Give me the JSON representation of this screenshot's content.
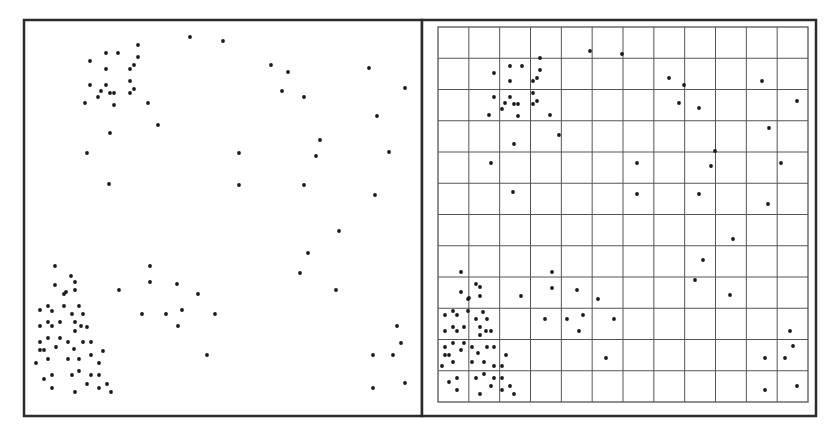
{
  "colors": {
    "background": "#ffffff",
    "frame": "#2a2a2a",
    "grid": "#555555",
    "point": "#1a1a1a"
  },
  "chart_data": [
    {
      "type": "scatter",
      "title": "",
      "xlabel": "",
      "ylabel": "",
      "grid": false,
      "legend": null,
      "panel": "left",
      "coordinate_space": "pixel",
      "points": [
        [
          138,
          45
        ],
        [
          106,
          53
        ],
        [
          118,
          53
        ],
        [
          90,
          61
        ],
        [
          138,
          57
        ],
        [
          106,
          69
        ],
        [
          134,
          65
        ],
        [
          130,
          69
        ],
        [
          90,
          85
        ],
        [
          106,
          85
        ],
        [
          130,
          81
        ],
        [
          134,
          89
        ],
        [
          101,
          91
        ],
        [
          110,
          93
        ],
        [
          114,
          93
        ],
        [
          130,
          93
        ],
        [
          98,
          97
        ],
        [
          85,
          103
        ],
        [
          114,
          105
        ],
        [
          148,
          103
        ],
        [
          158,
          125
        ],
        [
          110,
          133
        ],
        [
          87,
          153
        ],
        [
          109,
          184
        ],
        [
          190,
          37
        ],
        [
          223,
          41
        ],
        [
          271,
          65
        ],
        [
          288,
          72
        ],
        [
          282,
          91
        ],
        [
          304,
          97
        ],
        [
          369,
          68
        ],
        [
          405,
          88
        ],
        [
          377,
          116
        ],
        [
          320,
          140
        ],
        [
          316,
          156
        ],
        [
          239,
          153
        ],
        [
          389,
          152
        ],
        [
          239,
          185
        ],
        [
          304,
          185
        ],
        [
          375,
          195
        ],
        [
          339,
          231
        ],
        [
          308,
          253
        ],
        [
          300,
          273
        ],
        [
          336,
          290
        ],
        [
          397,
          326
        ],
        [
          401,
          343
        ],
        [
          373,
          355
        ],
        [
          393,
          355
        ],
        [
          373,
          388
        ],
        [
          405,
          383
        ],
        [
          150,
          266
        ],
        [
          150,
          282
        ],
        [
          177,
          284
        ],
        [
          198,
          294
        ],
        [
          142,
          314
        ],
        [
          166,
          314
        ],
        [
          182,
          310
        ],
        [
          215,
          314
        ],
        [
          178,
          326
        ],
        [
          207,
          355
        ],
        [
          119,
          290
        ],
        [
          55,
          266
        ],
        [
          71,
          276
        ],
        [
          75,
          282
        ],
        [
          55,
          285
        ],
        [
          64,
          294
        ],
        [
          66,
          292
        ],
        [
          75,
          290
        ],
        [
          40,
          310
        ],
        [
          48,
          306
        ],
        [
          52,
          311
        ],
        [
          64,
          306
        ],
        [
          79,
          306
        ],
        [
          72,
          314
        ],
        [
          83,
          314
        ],
        [
          40,
          326
        ],
        [
          48,
          322
        ],
        [
          52,
          326
        ],
        [
          60,
          322
        ],
        [
          75,
          322
        ],
        [
          75,
          331
        ],
        [
          81,
          326
        ],
        [
          87,
          327
        ],
        [
          40,
          342
        ],
        [
          48,
          338
        ],
        [
          60,
          338
        ],
        [
          68,
          342
        ],
        [
          83,
          342
        ],
        [
          91,
          342
        ],
        [
          40,
          350
        ],
        [
          44,
          350
        ],
        [
          48,
          359
        ],
        [
          56,
          347
        ],
        [
          74,
          349
        ],
        [
          103,
          351
        ],
        [
          68,
          359
        ],
        [
          79,
          359
        ],
        [
          91,
          355
        ],
        [
          36,
          363
        ],
        [
          99,
          363
        ],
        [
          44,
          379
        ],
        [
          52,
          375
        ],
        [
          72,
          375
        ],
        [
          79,
          371
        ],
        [
          91,
          375
        ],
        [
          99,
          375
        ],
        [
          87,
          384
        ],
        [
          107,
          384
        ],
        [
          52,
          388
        ],
        [
          75,
          392
        ],
        [
          99,
          388
        ],
        [
          111,
          392
        ]
      ]
    },
    {
      "type": "scatter",
      "title": "",
      "xlabel": "",
      "ylabel": "",
      "grid": true,
      "grid_cells": [
        12,
        12
      ],
      "legend": null,
      "panel": "right",
      "coordinate_space": "pixel",
      "points": [
        [
          540,
          58
        ],
        [
          510,
          66
        ],
        [
          522,
          66
        ],
        [
          494,
          73
        ],
        [
          540,
          70
        ],
        [
          510,
          81
        ],
        [
          537,
          78
        ],
        [
          533,
          81
        ],
        [
          494,
          97
        ],
        [
          510,
          97
        ],
        [
          533,
          93
        ],
        [
          537,
          101
        ],
        [
          505,
          103
        ],
        [
          514,
          104
        ],
        [
          518,
          104
        ],
        [
          533,
          104
        ],
        [
          502,
          109
        ],
        [
          489,
          115
        ],
        [
          518,
          116
        ],
        [
          550,
          115
        ],
        [
          559,
          135
        ],
        [
          514,
          144
        ],
        [
          491,
          163
        ],
        [
          513,
          192
        ],
        [
          590,
          51
        ],
        [
          622,
          54
        ],
        [
          669,
          78
        ],
        [
          684,
          85
        ],
        [
          679,
          103
        ],
        [
          699,
          108
        ],
        [
          762,
          81
        ],
        [
          797,
          101
        ],
        [
          769,
          128
        ],
        [
          715,
          151
        ],
        [
          711,
          166
        ],
        [
          637,
          163
        ],
        [
          781,
          163
        ],
        [
          637,
          194
        ],
        [
          699,
          194
        ],
        [
          768,
          204
        ],
        [
          733,
          239
        ],
        [
          703,
          260
        ],
        [
          695,
          280
        ],
        [
          730,
          295
        ],
        [
          790,
          331
        ],
        [
          793,
          346
        ],
        [
          765,
          358
        ],
        [
          785,
          358
        ],
        [
          765,
          390
        ],
        [
          797,
          386
        ],
        [
          552,
          272
        ],
        [
          552,
          288
        ],
        [
          577,
          290
        ],
        [
          598,
          299
        ],
        [
          545,
          319
        ],
        [
          567,
          319
        ],
        [
          583,
          315
        ],
        [
          614,
          319
        ],
        [
          579,
          331
        ],
        [
          606,
          358
        ],
        [
          521,
          296
        ],
        [
          461,
          272
        ],
        [
          476,
          284
        ],
        [
          480,
          287
        ],
        [
          461,
          292
        ],
        [
          468,
          299
        ],
        [
          469,
          298
        ],
        [
          480,
          296
        ],
        [
          445,
          315
        ],
        [
          453,
          311
        ],
        [
          457,
          315
        ],
        [
          468,
          311
        ],
        [
          483,
          312
        ],
        [
          476,
          319
        ],
        [
          487,
          319
        ],
        [
          445,
          331
        ],
        [
          453,
          327
        ],
        [
          457,
          331
        ],
        [
          464,
          327
        ],
        [
          480,
          327
        ],
        [
          480,
          335
        ],
        [
          486,
          331
        ],
        [
          491,
          331
        ],
        [
          445,
          347
        ],
        [
          453,
          343
        ],
        [
          464,
          343
        ],
        [
          472,
          347
        ],
        [
          487,
          347
        ],
        [
          494,
          347
        ],
        [
          445,
          355
        ],
        [
          449,
          355
        ],
        [
          453,
          362
        ],
        [
          461,
          350
        ],
        [
          478,
          353
        ],
        [
          506,
          355
        ],
        [
          472,
          362
        ],
        [
          484,
          362
        ],
        [
          494,
          366
        ],
        [
          442,
          366
        ],
        [
          502,
          366
        ],
        [
          449,
          382
        ],
        [
          457,
          378
        ],
        [
          476,
          378
        ],
        [
          484,
          374
        ],
        [
          494,
          378
        ],
        [
          502,
          378
        ],
        [
          491,
          386
        ],
        [
          510,
          386
        ],
        [
          457,
          390
        ],
        [
          480,
          394
        ],
        [
          502,
          390
        ],
        [
          514,
          394
        ]
      ]
    }
  ]
}
